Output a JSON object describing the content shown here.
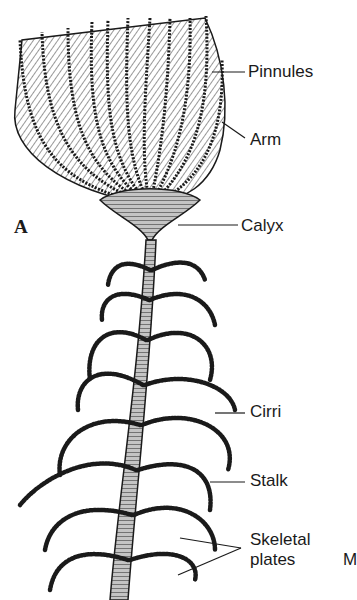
{
  "figure": {
    "panel_label": "A",
    "labels": [
      {
        "id": "pinnules",
        "text": "Pinnules"
      },
      {
        "id": "arm",
        "text": "Arm"
      },
      {
        "id": "calyx",
        "text": "Calyx"
      },
      {
        "id": "cirri",
        "text": "Cirri"
      },
      {
        "id": "stalk",
        "text": "Stalk"
      },
      {
        "id": "skeletal-plates-line1",
        "text": "Skeletal"
      },
      {
        "id": "skeletal-plates-line2",
        "text": "plates"
      },
      {
        "id": "cropped-next-panel",
        "text": "M"
      }
    ]
  },
  "colors": {
    "ink": "#1a1a1a",
    "stipple": "#b8b8b8",
    "background": "#ffffff"
  }
}
